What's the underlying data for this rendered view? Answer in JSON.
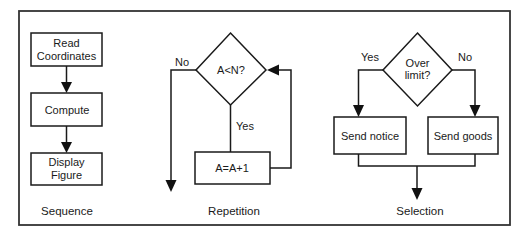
{
  "figure": {
    "sections": [
      {
        "caption": "Sequence",
        "steps": [
          "Read Coordinates",
          "Compute",
          "Display Figure"
        ],
        "step_lines": [
          [
            "Read",
            "Coordinates"
          ],
          [
            "Compute"
          ],
          [
            "Display",
            "Figure"
          ]
        ]
      },
      {
        "caption": "Repetition",
        "decision": "A<N?",
        "yes_label": "Yes",
        "no_label": "No",
        "action": "A=A+1"
      },
      {
        "caption": "Selection",
        "decision_lines": [
          "Over",
          "limit?"
        ],
        "yes_label": "Yes",
        "no_label": "No",
        "yes_action": "Send notice",
        "no_action": "Send goods"
      }
    ]
  },
  "colors": {
    "line": "#1a1a1a",
    "frame": "#333333",
    "background": "#ffffff"
  }
}
